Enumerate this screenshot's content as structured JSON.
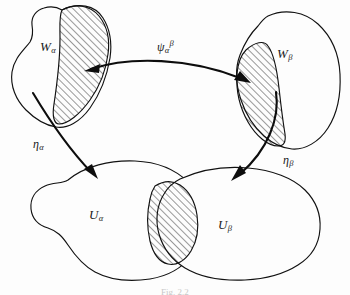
{
  "figure": {
    "type": "mathematical-diagram",
    "background_color": "#fdfdfd",
    "ink_color": "#111111",
    "caption": "Fig. 2.2",
    "sets": [
      {
        "id": "W-alpha",
        "base": "W",
        "subscript": "α",
        "label_x": 47,
        "label_y": 45,
        "role": "upper-left total-space chart domain",
        "has_hatched_subregion": true
      },
      {
        "id": "W-beta",
        "base": "W",
        "subscript": "β",
        "label_x": 284,
        "label_y": 52,
        "role": "upper-right total-space chart domain",
        "has_hatched_subregion": true
      },
      {
        "id": "U-alpha",
        "base": "U",
        "subscript": "α",
        "label_x": 96,
        "label_y": 213,
        "role": "lower-left base-space open set",
        "has_hatched_subregion": true
      },
      {
        "id": "U-beta",
        "base": "U",
        "subscript": "β",
        "label_x": 225,
        "label_y": 223,
        "role": "lower-right base-space open set",
        "has_hatched_subregion": true
      }
    ],
    "maps": [
      {
        "id": "psi-alpha-beta",
        "base": "ψ",
        "subscript": "α",
        "superscript": "β",
        "label_x": 162,
        "label_y": 44,
        "from": "W-alpha",
        "to": "W-beta",
        "arrow_style": "double-headed-curve",
        "description": "transition map between overlapping chart domains"
      },
      {
        "id": "eta-alpha",
        "base": "η",
        "subscript": "α",
        "label_x": 38,
        "label_y": 141,
        "from": "W-alpha",
        "to": "U-alpha",
        "arrow_style": "single-headed-curve",
        "description": "projection from chart domain to base open set"
      },
      {
        "id": "eta-beta",
        "base": "η",
        "subscript": "β",
        "label_x": 288,
        "label_y": 157,
        "from": "W-beta",
        "to": "U-beta",
        "arrow_style": "single-headed-curve",
        "description": "projection from chart domain to base open set"
      }
    ],
    "hatched_regions": [
      {
        "id": "hatch-W-alpha",
        "belongs_to": "W-alpha",
        "meaning": "overlap region"
      },
      {
        "id": "hatch-W-beta",
        "belongs_to": "W-beta",
        "meaning": "overlap region"
      },
      {
        "id": "hatch-U-intersection",
        "belongs_to": "U-alpha ∩ U-beta",
        "meaning": "intersection of base open sets"
      }
    ]
  }
}
